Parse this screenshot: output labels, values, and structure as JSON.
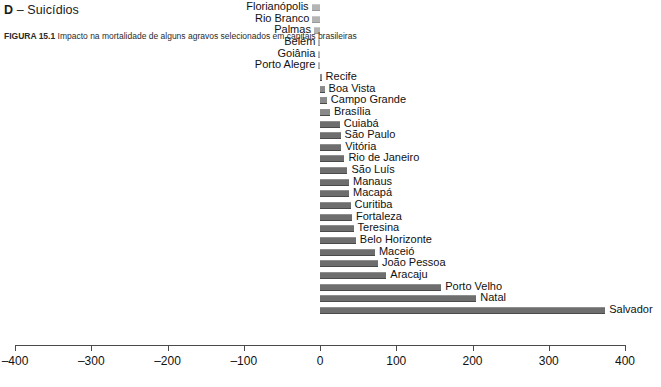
{
  "panel": {
    "letter": "D",
    "dash": " – ",
    "title": "Suicídios",
    "full_title": "D – Suicídios"
  },
  "axis": {
    "ticks": [
      -400,
      -300,
      -200,
      -100,
      0,
      100,
      200,
      300,
      400
    ],
    "tick_labels": [
      "–400",
      "–300",
      "–200",
      "–100",
      "0",
      "100",
      "200",
      "300",
      "400"
    ],
    "min": -400,
    "max": 400
  },
  "caption": {
    "figure_number": "FIGURA 15.1",
    "text": "Impacto na mortalidade de alguns agravos selecionados em capitais brasileiras"
  },
  "colors": {
    "bar_positive": "#6e6e6e",
    "bar_negative": "#b4b4b4",
    "axis": "#4a4a4a",
    "text": "#111111",
    "background": "#ffffff"
  },
  "chart_data": {
    "type": "bar",
    "orientation": "horizontal",
    "title": "D – Suicídios",
    "xlabel": "",
    "ylabel": "",
    "xlim": [
      -400,
      400
    ],
    "grid": false,
    "legend": false,
    "categories": [
      "Florianópolis",
      "Rio Branco",
      "Palmas",
      "Belém",
      "Goiânia",
      "Porto Alegre",
      "Recife",
      "Boa Vista",
      "Campo Grande",
      "Brasília",
      "Cuiabá",
      "São Paulo",
      "Vitória",
      "Rio de Janeiro",
      "São Luís",
      "Manaus",
      "Macapá",
      "Curitiba",
      "Fortaleza",
      "Teresina",
      "Belo Horizonte",
      "Maceió",
      "João Pessoa",
      "Aracaju",
      "Porto Velho",
      "Natal",
      "Salvador"
    ],
    "values": [
      -11,
      -10,
      -8,
      -2,
      -2,
      -2,
      2,
      6,
      9,
      13,
      26,
      27,
      28,
      32,
      36,
      38,
      38,
      40,
      42,
      44,
      47,
      72,
      76,
      87,
      159,
      205,
      374
    ]
  }
}
